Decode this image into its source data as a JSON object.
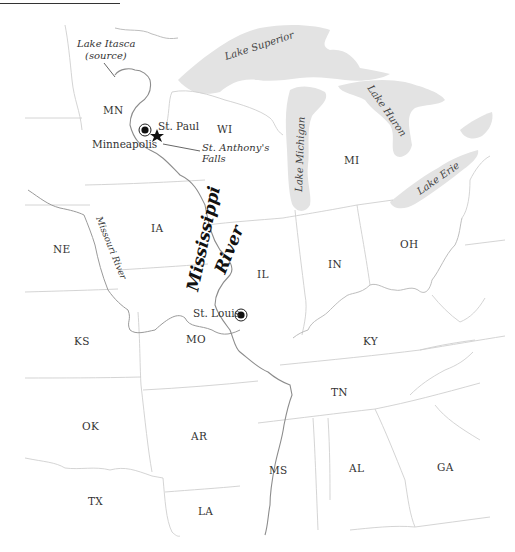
{
  "map": {
    "title": "Mississippi River",
    "title_line1": "Mississippi",
    "title_line2": "River",
    "states": [
      {
        "abbr": "MN"
      },
      {
        "abbr": "WI"
      },
      {
        "abbr": "MI"
      },
      {
        "abbr": "IA"
      },
      {
        "abbr": "NE"
      },
      {
        "abbr": "IL"
      },
      {
        "abbr": "IN"
      },
      {
        "abbr": "OH"
      },
      {
        "abbr": "KS"
      },
      {
        "abbr": "MO"
      },
      {
        "abbr": "KY"
      },
      {
        "abbr": "TN"
      },
      {
        "abbr": "OK"
      },
      {
        "abbr": "AR"
      },
      {
        "abbr": "MS"
      },
      {
        "abbr": "AL"
      },
      {
        "abbr": "GA"
      },
      {
        "abbr": "TX"
      },
      {
        "abbr": "LA"
      }
    ],
    "cities": {
      "st_paul": "St. Paul",
      "minneapolis": "Minneapolis",
      "st_louis": "St. Louis"
    },
    "annotations": {
      "lake_itasca_line1": "Lake Itasca",
      "lake_itasca_line2": "(source)",
      "st_anthony_line1": "St. Anthony's",
      "st_anthony_line2": "Falls",
      "missouri_river": "Missouri River"
    },
    "lakes": {
      "superior": "Lake Superior",
      "michigan": "Lake Michigan",
      "huron": "Lake Huron",
      "erie": "Lake Erie"
    },
    "colors": {
      "water": "#e3e3e3",
      "border": "#cfcfcf",
      "river": "#8c8c8c",
      "text": "#333333"
    }
  }
}
